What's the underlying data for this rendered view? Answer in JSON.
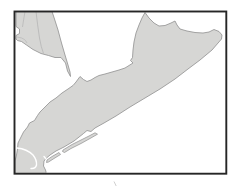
{
  "map": {
    "colors": {
      "water": "#ffffff",
      "land": "#d6d6d4",
      "coastline": "#8f8f8f",
      "frame": "#262626",
      "inner_boundary": "#b5b5b5",
      "channel": "#ffffff",
      "stray_mark": "#a8a8a8"
    },
    "frame": {
      "x": 14.5,
      "y": 11.5,
      "width": 211.8,
      "height": 162.2,
      "stroke_width": 1.9
    },
    "regions": {
      "northwest_landmass": {
        "points": "16,11.5 52,11.5 54.5,19 58,30 61.5,43 65,55 68,65 70,72 70.5,76.5 67.5,71 65.5,63 61,57.5 55,57.5 48.5,55.5 41,53.5 33,49.5 26.5,45 21.5,41.5 17.5,40.5 16,39 16,35.5 19.5,33.5 19.5,29 16,26.5"
      },
      "main_landmass": {
        "points": "145,12.5 149,18 154,23 159,26 165,25.5 171,23 175,21 177,25 180,29 187,31 195,32.5 203,33 209,32 214,29.5 219,31.5 222,35 221.5,39 212,50 200,60 188,69 175,79 160,89 145,98 130,107 116,116 104,123 95,128 91,131.5 87,130.5 83.5,133.5 74,141 64,147 56,151 50,155 46.5,158 44,161 43.5,166 45.5,170 46.5,173.5 15,173.5 15,161 16.5,155 17.5,149 18,143 21,137 23.5,132 27.5,127 29.5,123 34.5,120.5 37.5,115.5 40,112 44,108 50,102 56,98 62,93 68,89 73,85.5 76,82 80,76.5 83.5,79.5 87,81.5 91,80 95,77.5 99,75.5 105,74 112,72 119,70 125,68 129,65.5 133,63 130.5,60.5 132.5,57.5 133,50 134,42 136,33 139,25 142,18"
      },
      "barrier_island_west": {
        "points": "47,160 52,156.5 59,152.5 60.5,154.5 54,158.5 48.5,162 46.5,162.5"
      },
      "barrier_island_east": {
        "points": "63,150 72,144.5 81,140 89,136 95,132.8 97.5,134.2 90,138.5 81,143.5 71,148.5 64.5,152.5 62.5,151.5"
      }
    },
    "water_channels": {
      "hook_inlet": "M 17,148 Q 27,149 33,155 Q 37,160 36.5,165 Q 35.5,169 31,168.5",
      "notch_inlet": "M 44,156.5 Q 48.5,161 49,166.5 Q 49.2,170.5 47,173"
    },
    "inner_boundaries": {
      "line_a": "M 36,11.5 Q 37.5,25 39.5,38 Q 41,47 43.5,53.5",
      "line_b": "M 25,11.5 Q 23.5,20 22.5,27",
      "line_c": "M 17,37 Q 22,37.5 24.5,39.5 Q 26,41 27,43"
    },
    "stray_mark_path": "M 114,181.5 l 2.2,4.5"
  }
}
